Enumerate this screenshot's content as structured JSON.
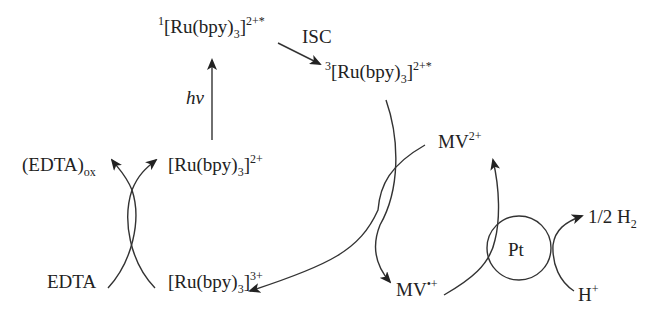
{
  "diagram": {
    "type": "photocatalytic hydrogen evolution cycle",
    "species": {
      "singlet_excited": {
        "pre": "1",
        "main": "[Ru(bpy)",
        "sub": "3",
        "close": "]",
        "sup": "2+*"
      },
      "triplet_excited": {
        "pre": "3",
        "main": "[Ru(bpy)",
        "sub": "3",
        "close": "]",
        "sup": "2+*"
      },
      "ground_state": {
        "main": "[Ru(bpy)",
        "sub": "3",
        "close": "]",
        "sup": "2+"
      },
      "oxidized_ru": {
        "main": "[Ru(bpy)",
        "sub": "3",
        "close": "]",
        "sup": "3+"
      },
      "edta": {
        "main": "EDTA"
      },
      "edta_ox": {
        "main": "(EDTA)",
        "sub": "ox"
      },
      "mv2": {
        "main": "MV",
        "sup": "2+"
      },
      "mv_radical": {
        "main": "MV",
        "sup": "•+"
      },
      "h_plus": {
        "main": "H",
        "sup": "+"
      },
      "h2": {
        "main": "1/2 H",
        "sub": "2"
      },
      "catalyst": {
        "main": "Pt"
      }
    },
    "annotations": {
      "photon": "hν",
      "isc": "ISC"
    },
    "colors": {
      "ink": "#222222",
      "background": "#ffffff"
    }
  }
}
